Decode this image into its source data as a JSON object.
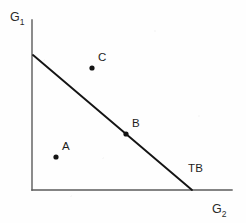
{
  "figure": {
    "background_color": "#fefefe",
    "ink_color": "#1d1d1d",
    "axis_color": "#555555",
    "width": 246,
    "height": 223
  },
  "axes": {
    "y_label_main": "G",
    "y_label_sub": "1",
    "x_label_main": "G",
    "x_label_sub": "2",
    "y_axis": {
      "x": 32,
      "y_top": 20,
      "y_bottom": 190
    },
    "x_axis": {
      "y": 190,
      "x_left": 32,
      "x_right": 232
    }
  },
  "chart_data": {
    "type": "scatter",
    "title": "",
    "xlabel": "G2",
    "ylabel": "G1",
    "grid": false,
    "legend": null,
    "xlim": [
      0,
      200
    ],
    "ylim": [
      0,
      170
    ],
    "lines": [
      {
        "name": "TB",
        "label": "TB",
        "description": "total budget constraint line",
        "x": [
          1,
          160
        ],
        "y": [
          135,
          0
        ],
        "pixel_start": {
          "x": 33,
          "y": 55
        },
        "pixel_end": {
          "x": 192,
          "y": 190
        }
      }
    ],
    "points": [
      {
        "label": "A",
        "x": 24,
        "y": 33,
        "position_relative_to_line": "inside",
        "pixel": {
          "x": 56,
          "y": 157
        },
        "label_pixel": {
          "x": 62,
          "y": 141
        }
      },
      {
        "label": "B",
        "x": 94,
        "y": 56,
        "position_relative_to_line": "on",
        "pixel": {
          "x": 126,
          "y": 134
        },
        "label_pixel": {
          "x": 132,
          "y": 118
        }
      },
      {
        "label": "C",
        "x": 60,
        "y": 122,
        "position_relative_to_line": "outside",
        "pixel": {
          "x": 92,
          "y": 68
        },
        "label_pixel": {
          "x": 98,
          "y": 52
        }
      }
    ],
    "annotations": [
      {
        "text": "TB",
        "pixel": {
          "x": 188,
          "y": 163
        }
      }
    ]
  }
}
